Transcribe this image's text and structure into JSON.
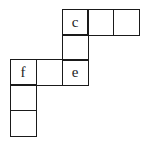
{
  "diagram": {
    "type": "cube-net",
    "cell_size_px": 25.5,
    "origin_px": [
      10,
      9
    ],
    "cells": [
      {
        "row": 0,
        "col": 2,
        "label": "c"
      },
      {
        "row": 0,
        "col": 3,
        "label": ""
      },
      {
        "row": 0,
        "col": 4,
        "label": ""
      },
      {
        "row": 1,
        "col": 2,
        "label": ""
      },
      {
        "row": 2,
        "col": 0,
        "label": "f"
      },
      {
        "row": 2,
        "col": 1,
        "label": ""
      },
      {
        "row": 2,
        "col": 2,
        "label": "e"
      },
      {
        "row": 3,
        "col": 0,
        "label": ""
      },
      {
        "row": 4,
        "col": 0,
        "label": ""
      }
    ]
  }
}
